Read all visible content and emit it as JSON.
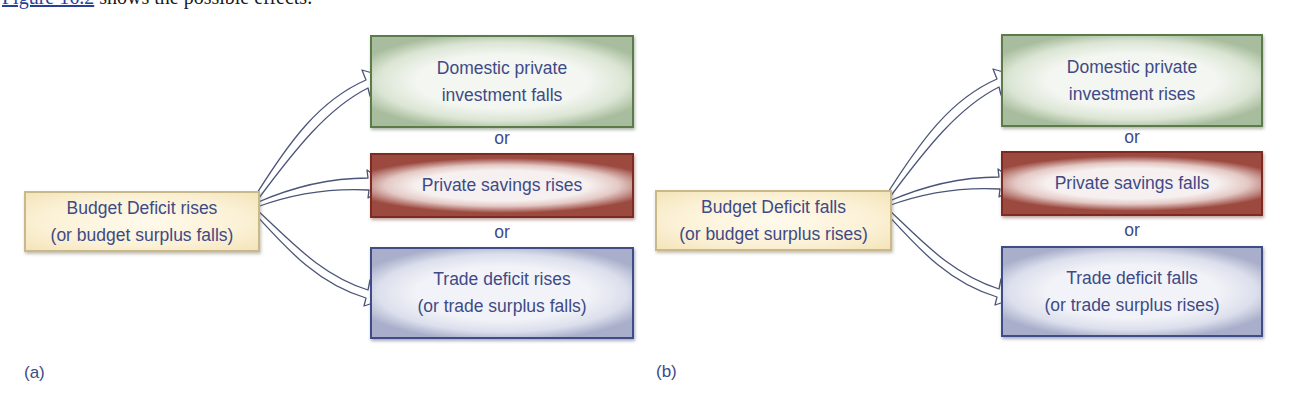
{
  "intro": {
    "link_text": "Figure 16.2",
    "rest_text": " shows the possible effects."
  },
  "diagram": {
    "panels": [
      {
        "label": "(a)",
        "source": {
          "line1": "Budget Deficit rises",
          "line2": "(or budget surplus falls)"
        },
        "targets": [
          {
            "color": "green",
            "line1": "Domestic private",
            "line2": "investment falls"
          },
          {
            "color": "red",
            "line1": "Private savings rises",
            "line2": ""
          },
          {
            "color": "blue",
            "line1": "Trade deficit rises",
            "line2": "(or trade surplus falls)"
          }
        ],
        "connector_1": "or",
        "connector_2": "or"
      },
      {
        "label": "(b)",
        "source": {
          "line1": "Budget Deficit falls",
          "line2": "(or budget surplus rises)"
        },
        "targets": [
          {
            "color": "green",
            "line1": "Domestic private",
            "line2": "investment rises"
          },
          {
            "color": "red",
            "line1": "Private savings falls",
            "line2": ""
          },
          {
            "color": "blue",
            "line1": "Trade deficit falls",
            "line2": "(or trade surplus rises)"
          }
        ],
        "connector_1": "or",
        "connector_2": "or"
      }
    ]
  },
  "colors": {
    "text": "#3e4a86",
    "source_border": "#c9b98a",
    "green_border": "#5d7a4a",
    "red_border": "#7c2a22",
    "blue_border": "#3f4c86",
    "arrow_stroke": "#4a5578",
    "link": "#2a3f9a"
  }
}
